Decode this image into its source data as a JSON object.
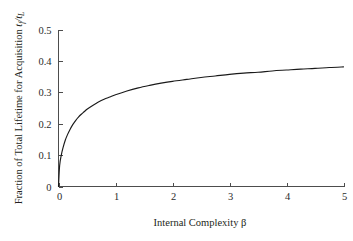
{
  "chart_data": {
    "type": "line",
    "title": "",
    "subtitle": "",
    "xlabel": "Internal Complexity β",
    "ylabel_plain": "Fraction of Total Lifetime for Acquisition t_f/t_L",
    "ylabel_parts": {
      "text": "Fraction of Total Lifetime for Acquisition ",
      "var1": "t",
      "var1_sub": "f",
      "slash": "/",
      "var2": "t",
      "var2_sub": "L"
    },
    "xlim": [
      0,
      5
    ],
    "ylim": [
      0,
      0.5
    ],
    "xticks": [
      0,
      1,
      2,
      3,
      4,
      5
    ],
    "xtick_labels": [
      "0",
      "1",
      "2",
      "3",
      "4",
      "5"
    ],
    "yticks": [
      0,
      0.1,
      0.2,
      0.3,
      0.4,
      0.5
    ],
    "ytick_labels": [
      "0",
      "0.1",
      "0.2",
      "0.3",
      "0.4",
      "0.5"
    ],
    "grid": false,
    "legend": false,
    "legend_position": "none",
    "series": [
      {
        "name": "Fraction of total lifetime for acquisition",
        "color": "#1a1a1a",
        "x": [
          0.0,
          0.02,
          0.05,
          0.08,
          0.12,
          0.16,
          0.2,
          0.25,
          0.3,
          0.35,
          0.4,
          0.45,
          0.5,
          0.6,
          0.7,
          0.8,
          0.9,
          1.0,
          1.2,
          1.4,
          1.6,
          1.8,
          2.0,
          2.25,
          2.5,
          2.75,
          3.0,
          3.25,
          3.5,
          3.75,
          4.0,
          4.25,
          4.5,
          4.75,
          5.0
        ],
        "y": [
          0.0,
          0.067,
          0.101,
          0.124,
          0.148,
          0.166,
          0.181,
          0.197,
          0.21,
          0.221,
          0.23,
          0.238,
          0.246,
          0.258,
          0.269,
          0.278,
          0.285,
          0.292,
          0.304,
          0.314,
          0.322,
          0.329,
          0.335,
          0.341,
          0.347,
          0.352,
          0.357,
          0.361,
          0.364,
          0.368,
          0.371,
          0.374,
          0.376,
          0.379,
          0.381
        ]
      }
    ],
    "curve_endpoints": {
      "start": {
        "x": 0,
        "y": 0
      },
      "end": {
        "x": 5,
        "y": 0.451
      }
    },
    "sampled_readings": [
      {
        "x": 0.5,
        "y": 0.265
      },
      {
        "x": 1.0,
        "y": 0.326
      },
      {
        "x": 2.0,
        "y": 0.406
      },
      {
        "x": 3.0,
        "y": 0.43
      },
      {
        "x": 4.0,
        "y": 0.443
      },
      {
        "x": 5.0,
        "y": 0.451
      }
    ],
    "colors": {
      "curve": "#1a1a1a",
      "axis": "#4d4d4d",
      "text": "#231f20",
      "background": "#ffffff"
    }
  }
}
